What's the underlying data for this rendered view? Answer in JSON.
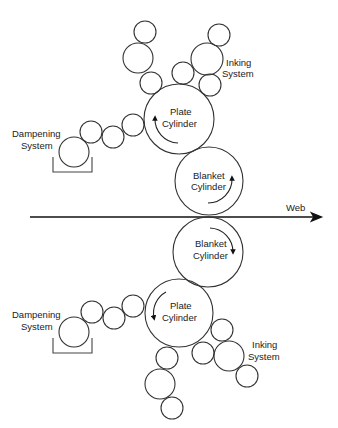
{
  "colors": {
    "stroke": "#333333",
    "text": "#222222",
    "background": "#ffffff"
  },
  "web": {
    "label": "Web",
    "x1": 30,
    "x2": 325,
    "y": 217,
    "label_x": 286,
    "label_y": 211
  },
  "upper_unit": {
    "plate_cylinder": {
      "label_line1": "Plate",
      "label_line2": "Cylinder",
      "cx": 179,
      "cy": 119,
      "r": 35,
      "rotation": "counterclockwise"
    },
    "blanket_cylinder": {
      "label_line1": "Blanket",
      "label_line2": "Cylinder",
      "cx": 209,
      "cy": 181,
      "r": 34,
      "rotation": "counterclockwise"
    },
    "inking_system": {
      "label_line1": "Inking",
      "label_line2": "System",
      "rollers": [
        {
          "cx": 145,
          "cy": 32,
          "r": 11
        },
        {
          "cx": 138,
          "cy": 58,
          "r": 15
        },
        {
          "cx": 151,
          "cy": 83,
          "r": 11
        },
        {
          "cx": 183,
          "cy": 73,
          "r": 11
        },
        {
          "cx": 219,
          "cy": 35,
          "r": 11
        },
        {
          "cx": 207,
          "cy": 59,
          "r": 16
        },
        {
          "cx": 210,
          "cy": 85,
          "r": 11
        }
      ]
    },
    "dampening_system": {
      "label_line1": "Dampening",
      "label_line2": "System",
      "rollers": [
        {
          "cx": 74,
          "cy": 152,
          "r": 15
        },
        {
          "cx": 91,
          "cy": 132,
          "r": 11
        },
        {
          "cx": 113,
          "cy": 137,
          "r": 11
        },
        {
          "cx": 133,
          "cy": 125,
          "r": 11
        }
      ],
      "tray": {
        "x1": 53,
        "x2": 92,
        "y_top": 157,
        "y_bottom": 172
      }
    }
  },
  "lower_unit": {
    "plate_cylinder": {
      "label_line1": "Plate",
      "label_line2": "Cylinder",
      "cx": 179,
      "cy": 313,
      "r": 34,
      "rotation": "counterclockwise"
    },
    "blanket_cylinder": {
      "label_line1": "Blanket",
      "label_line2": "Cylinder",
      "cx": 208,
      "cy": 252,
      "r": 35,
      "rotation": "clockwise"
    },
    "inking_system": {
      "label_line1": "Inking",
      "label_line2": "System",
      "rollers": [
        {
          "cx": 167,
          "cy": 358,
          "r": 11
        },
        {
          "cx": 160,
          "cy": 384,
          "r": 15
        },
        {
          "cx": 172,
          "cy": 408,
          "r": 11
        },
        {
          "cx": 203,
          "cy": 353,
          "r": 11
        },
        {
          "cx": 222,
          "cy": 330,
          "r": 11
        },
        {
          "cx": 229,
          "cy": 356,
          "r": 15
        },
        {
          "cx": 247,
          "cy": 376,
          "r": 11
        }
      ]
    },
    "dampening_system": {
      "label_line1": "Dampening",
      "label_line2": "System",
      "rollers": [
        {
          "cx": 74,
          "cy": 332,
          "r": 15
        },
        {
          "cx": 92,
          "cy": 312,
          "r": 11
        },
        {
          "cx": 114,
          "cy": 318,
          "r": 11
        },
        {
          "cx": 133,
          "cy": 306,
          "r": 11
        }
      ],
      "tray": {
        "x1": 53,
        "x2": 92,
        "y_top": 338,
        "y_bottom": 353
      }
    }
  }
}
